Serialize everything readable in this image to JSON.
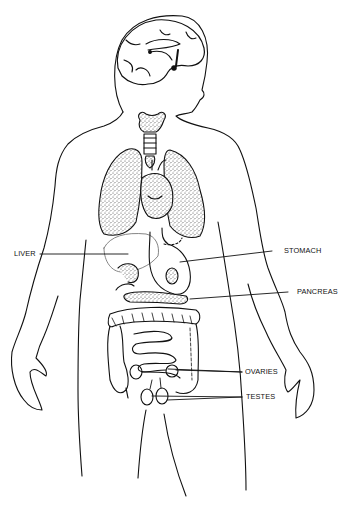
{
  "diagram": {
    "title": "",
    "labels": {
      "liver": "LIVER",
      "stomach": "STOMACH",
      "pancreas": "PANCREAS",
      "ovaries": "OVARIES",
      "testes": "TESTES"
    },
    "colors": {
      "line": "#111111",
      "stipple": "#555555",
      "background": "#ffffff"
    }
  }
}
